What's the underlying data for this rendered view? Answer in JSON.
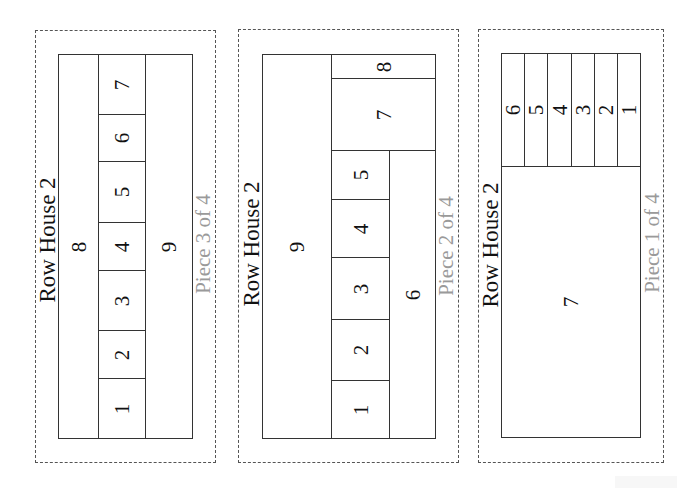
{
  "diagram": {
    "type": "floor-plan-pieces",
    "colors": {
      "line": "#333333",
      "dashed_border": "#555555",
      "title_text": "#111111",
      "piece_text": "#9a9a9a",
      "background": "#ffffff"
    },
    "panels": [
      {
        "id": "piece-3",
        "title": "Row House 2",
        "piece_label": "Piece 3 of 4",
        "frame": {
          "x": 35,
          "y": 30,
          "w": 181,
          "h": 433
        },
        "title_pos": {
          "x": 47,
          "y": 240
        },
        "piece_pos": {
          "x": 203,
          "y": 244
        },
        "cells": [
          {
            "label": "8",
            "x": 58,
            "y": 54,
            "w": 41,
            "h": 385
          },
          {
            "label": "7",
            "x": 98,
            "y": 54,
            "w": 48,
            "h": 61
          },
          {
            "label": "6",
            "x": 98,
            "y": 114,
            "w": 48,
            "h": 48
          },
          {
            "label": "5",
            "x": 98,
            "y": 161,
            "w": 48,
            "h": 62
          },
          {
            "label": "4",
            "x": 98,
            "y": 222,
            "w": 48,
            "h": 49
          },
          {
            "label": "3",
            "x": 98,
            "y": 270,
            "w": 48,
            "h": 61
          },
          {
            "label": "2",
            "x": 98,
            "y": 330,
            "w": 48,
            "h": 49
          },
          {
            "label": "1",
            "x": 98,
            "y": 378,
            "w": 48,
            "h": 61
          },
          {
            "label": "9",
            "x": 145,
            "y": 54,
            "w": 48,
            "h": 385
          }
        ]
      },
      {
        "id": "piece-2",
        "title": "Row House 2",
        "piece_label": "Piece 2 of 4",
        "frame": {
          "x": 238,
          "y": 29,
          "w": 221,
          "h": 434
        },
        "title_pos": {
          "x": 251,
          "y": 244
        },
        "piece_pos": {
          "x": 446,
          "y": 246
        },
        "cells": [
          {
            "label": "9",
            "x": 262,
            "y": 54,
            "w": 70,
            "h": 385
          },
          {
            "label": "8",
            "x": 331,
            "y": 54,
            "w": 105,
            "h": 25
          },
          {
            "label": "7",
            "x": 331,
            "y": 78,
            "w": 105,
            "h": 73
          },
          {
            "label": "5",
            "x": 331,
            "y": 150,
            "w": 59,
            "h": 50
          },
          {
            "label": "4",
            "x": 331,
            "y": 199,
            "w": 59,
            "h": 59
          },
          {
            "label": "3",
            "x": 331,
            "y": 257,
            "w": 59,
            "h": 63
          },
          {
            "label": "2",
            "x": 331,
            "y": 319,
            "w": 59,
            "h": 62
          },
          {
            "label": "1",
            "x": 331,
            "y": 380,
            "w": 59,
            "h": 59
          },
          {
            "label": "6",
            "x": 389,
            "y": 150,
            "w": 47,
            "h": 289
          }
        ]
      },
      {
        "id": "piece-1",
        "title": "Row House 2",
        "piece_label": "Piece 1 of 4",
        "frame": {
          "x": 478,
          "y": 29,
          "w": 186,
          "h": 434
        },
        "title_pos": {
          "x": 490,
          "y": 245
        },
        "piece_pos": {
          "x": 652,
          "y": 243
        },
        "cells": [
          {
            "label": "6",
            "x": 501,
            "y": 53,
            "w": 24,
            "h": 114
          },
          {
            "label": "5",
            "x": 524,
            "y": 53,
            "w": 24,
            "h": 114
          },
          {
            "label": "4",
            "x": 547,
            "y": 53,
            "w": 25,
            "h": 114
          },
          {
            "label": "3",
            "x": 571,
            "y": 53,
            "w": 24,
            "h": 114
          },
          {
            "label": "2",
            "x": 594,
            "y": 53,
            "w": 24,
            "h": 114
          },
          {
            "label": "1",
            "x": 617,
            "y": 53,
            "w": 24,
            "h": 114
          },
          {
            "label": "7",
            "x": 501,
            "y": 166,
            "w": 140,
            "h": 272
          }
        ]
      }
    ]
  }
}
